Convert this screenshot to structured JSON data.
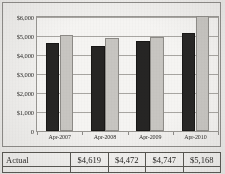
{
  "chart_data": {
    "type": "bar",
    "title": "",
    "xlabel": "",
    "ylabel": "",
    "grid": true,
    "legend_position": "none",
    "categories": [
      "Apr-2007",
      "Apr-2008",
      "Apr-2009",
      "Apr-2010"
    ],
    "ylim": [
      0,
      6000
    ],
    "yticks": [
      0,
      1000,
      2000,
      3000,
      4000,
      5000,
      6000
    ],
    "ytick_labels": [
      "0",
      "$1,000",
      "$2,000",
      "$3,000",
      "$4,000",
      "$5,000",
      "$6,000"
    ],
    "series": [
      {
        "name": "Actual",
        "color": "#262524",
        "values": [
          4619,
          4472,
          4747,
          5168
        ]
      },
      {
        "name": "Budget",
        "color": "#c9c7c3",
        "values": [
          5060,
          4890,
          4960,
          6070
        ]
      }
    ]
  },
  "table": {
    "rows": [
      {
        "label": "Actual",
        "values": [
          "$4,619",
          "$4,472",
          "$4,747",
          "$5,168"
        ]
      }
    ],
    "cut_row": {
      "label": "",
      "values": [
        "",
        "",
        "",
        ""
      ]
    }
  },
  "colors": {
    "actual_bar": "#262524",
    "budget_bar": "#c9c7c3",
    "frame_border": "#8d8b88",
    "grid": "#a9a7a3",
    "paper": "#f2f1ef",
    "text": "#1d1c1a"
  }
}
